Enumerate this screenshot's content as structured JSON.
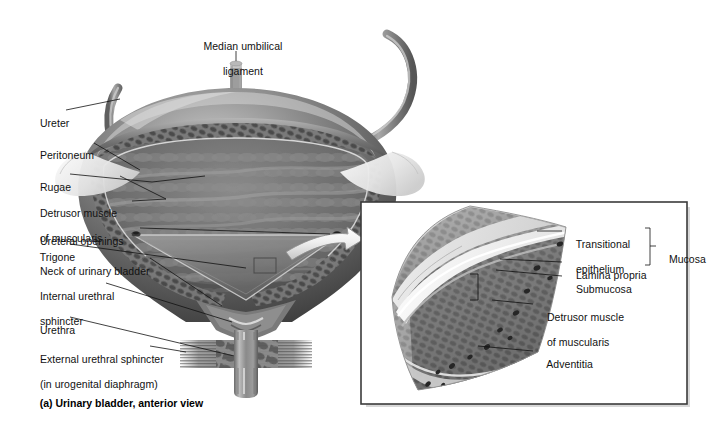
{
  "figure": {
    "title": "Urinary bladder, anterior view",
    "caption": "(a) Urinary bladder, anterior view",
    "type": "anatomical-illustration",
    "palette": {
      "background": "#ffffff",
      "text": "#111111",
      "leader_line": "#111111",
      "panel_border": "#3b3b3b",
      "tissue_dark": "#4a4a4a",
      "tissue_mid": "#8c8c8c",
      "tissue_light": "#d5d5d5",
      "peritoneum": "#ededed"
    }
  },
  "main_view": {
    "name": "Urinary bladder, anterior view, frontal section",
    "labels": [
      {
        "id": "median-umbilical-ligament",
        "line1": "Median umbilical",
        "line2": "ligament"
      },
      {
        "id": "ureter",
        "line1": "Ureter"
      },
      {
        "id": "peritoneum",
        "line1": "Peritoneum"
      },
      {
        "id": "rugae",
        "line1": "Rugae"
      },
      {
        "id": "detrusor-muscle",
        "line1": "Detrusor muscle",
        "line2": "of muscularis"
      },
      {
        "id": "ureteral-openings",
        "line1": "Ureteral openings"
      },
      {
        "id": "trigone",
        "line1": "Trigone"
      },
      {
        "id": "neck-of-urinary-bladder",
        "line1": "Neck of urinary bladder"
      },
      {
        "id": "internal-urethral-sphincter",
        "line1": "Internal urethral",
        "line2": "sphincter"
      },
      {
        "id": "urethra",
        "line1": "Urethra"
      },
      {
        "id": "external-urethral-sphincter",
        "line1": "External urethral sphincter",
        "line2": "(in urogenital diaphragm)"
      }
    ]
  },
  "inset_panel": {
    "name": "Magnified bladder wall cross-section",
    "labels": [
      {
        "id": "transitional-epithelium",
        "line1": "Transitional",
        "line2": "epithelium"
      },
      {
        "id": "lamina-propria",
        "line1": "Lamina propria"
      },
      {
        "id": "submucosa",
        "line1": "Submucosa"
      },
      {
        "id": "detrusor-muscle-inset",
        "line1": "Detrusor muscle",
        "line2": "of muscularis"
      },
      {
        "id": "adventitia",
        "line1": "Adventitia"
      }
    ],
    "bracket": {
      "id": "mucosa-bracket",
      "label": "Mucosa",
      "groups": [
        "Transitional epithelium",
        "Lamina propria"
      ]
    }
  }
}
